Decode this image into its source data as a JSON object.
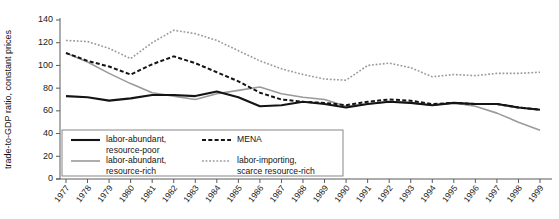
{
  "chart_data": {
    "type": "line",
    "title": "",
    "xlabel": "",
    "ylabel": "trade-to-GDP ratio, constant prices",
    "ylim": [
      0,
      140
    ],
    "yticks": [
      0,
      20,
      40,
      60,
      80,
      100,
      120,
      140
    ],
    "grid": false,
    "legend_position": "bottom-left",
    "categories": [
      "1977",
      "1978",
      "1979",
      "1980",
      "1981",
      "1982",
      "1983",
      "1984",
      "1985",
      "1986",
      "1987",
      "1988",
      "1989",
      "1990",
      "1991",
      "1992",
      "1993",
      "1994",
      "1995",
      "1996",
      "1997",
      "1998",
      "1999"
    ],
    "series": [
      {
        "name": "labor-abundant, resource-poor",
        "style": "solid",
        "color": "#141414",
        "width": 2.1,
        "values": [
          73,
          72,
          69,
          71,
          74,
          74,
          73,
          77,
          72,
          64,
          65,
          68,
          66,
          63,
          66,
          68,
          67,
          65,
          67,
          66,
          66,
          63,
          61
        ]
      },
      {
        "name": "labor-abundant, resource-rich",
        "style": "solid",
        "color": "#9a9a9a",
        "width": 1.6,
        "values": [
          111,
          103,
          93,
          84,
          76,
          73,
          70,
          75,
          78,
          81,
          75,
          72,
          70,
          64,
          66,
          68,
          67,
          65,
          67,
          64,
          58,
          50,
          43
        ]
      },
      {
        "name": "MENA",
        "style": "dashed",
        "color": "#141414",
        "width": 2.0,
        "values": [
          111,
          104,
          99,
          92,
          101,
          108,
          102,
          94,
          86,
          76,
          70,
          68,
          67,
          65,
          68,
          70,
          69,
          66,
          67,
          66,
          66,
          63,
          61
        ]
      },
      {
        "name": "labor-importing, scarce resource-rich",
        "style": "dotted",
        "color": "#9a9a9a",
        "width": 1.6,
        "values": [
          122,
          121,
          115,
          106,
          120,
          131,
          128,
          122,
          113,
          104,
          97,
          92,
          88,
          87,
          100,
          102,
          98,
          90,
          92,
          91,
          93,
          93,
          94
        ]
      }
    ]
  },
  "legend": {
    "entries": [
      {
        "label_line1": "labor-abundant,",
        "label_line2": "resource-poor",
        "series": 0
      },
      {
        "label_line1": "labor-abundant,",
        "label_line2": "resource-rich",
        "series": 1
      },
      {
        "label_line1": "MENA",
        "label_line2": "",
        "series": 2
      },
      {
        "label_line1": "labor-importing,",
        "label_line2": "scarce resource-rich",
        "series": 3
      }
    ]
  },
  "colors": {
    "black_series": "#141414",
    "gray_series": "#9a9a9a",
    "axis": "#5b5b5b",
    "background": "#ffffff"
  }
}
